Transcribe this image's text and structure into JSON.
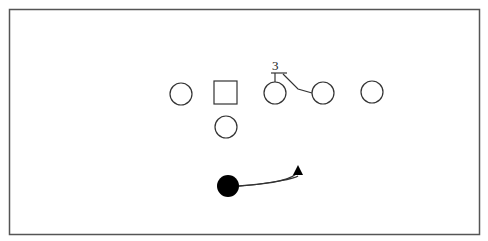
{
  "diagram": {
    "type": "football-play",
    "frame": {
      "x": 9,
      "y": 9,
      "w": 470,
      "h": 225,
      "stroke": "#555555"
    },
    "players": [
      {
        "id": "p1",
        "shape": "circle",
        "cx": 181,
        "cy": 94,
        "r": 11,
        "fill": "none"
      },
      {
        "id": "center",
        "shape": "square",
        "x": 214,
        "y": 81,
        "size": 23,
        "fill": "none"
      },
      {
        "id": "p3",
        "shape": "circle",
        "cx": 275,
        "cy": 93,
        "r": 11,
        "fill": "none"
      },
      {
        "id": "p4",
        "shape": "circle",
        "cx": 323,
        "cy": 93,
        "r": 11,
        "fill": "none"
      },
      {
        "id": "p5",
        "shape": "circle",
        "cx": 372,
        "cy": 92,
        "r": 11,
        "fill": "none"
      },
      {
        "id": "qb",
        "shape": "circle",
        "cx": 226,
        "cy": 127,
        "r": 11,
        "fill": "none"
      },
      {
        "id": "ball-carrier",
        "shape": "circle",
        "cx": 228,
        "cy": 186,
        "r": 11,
        "fill": "#000000"
      }
    ],
    "labels": [
      {
        "text": "3",
        "x": 276,
        "y": 68
      }
    ],
    "colors": {
      "stroke": "#333333",
      "filled": "#000000"
    }
  }
}
